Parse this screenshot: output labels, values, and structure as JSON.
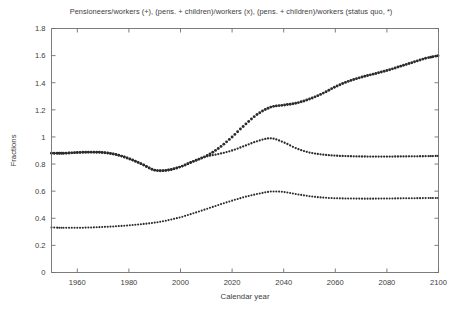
{
  "chart_data": {
    "type": "line",
    "title": "Pensioneers/workers (+), (pens. + children)/workers (x), (pens. + children)/workers (status quo, *)",
    "xlabel": "Calendar year",
    "ylabel": "Fractions",
    "xlim": [
      1950,
      2100
    ],
    "ylim": [
      0,
      1.8
    ],
    "xticks": [
      1960,
      1980,
      2000,
      2020,
      2040,
      2060,
      2080,
      2100
    ],
    "xticklabels": [
      "1960",
      "1980",
      "2000",
      "2020",
      "2040",
      "2060",
      "2080",
      "2100"
    ],
    "yticks": [
      0,
      0.2,
      0.4,
      0.6,
      0.8,
      1,
      1.2,
      1.4,
      1.6,
      1.8
    ],
    "yticklabels": [
      "0",
      "0.2",
      "0.4",
      "0.6",
      "0.8",
      "1",
      "1.2",
      "1.4",
      "1.6",
      "1.8"
    ],
    "grid": false,
    "legend": "none (series identified in title)",
    "marker_color": "#2b2b2b",
    "frame_color": "#6e6e6e",
    "x": [
      1950,
      1955,
      1960,
      1965,
      1970,
      1975,
      1980,
      1985,
      1990,
      1995,
      2000,
      2005,
      2010,
      2015,
      2020,
      2025,
      2030,
      2035,
      2040,
      2045,
      2050,
      2055,
      2060,
      2065,
      2070,
      2075,
      2080,
      2085,
      2090,
      2095,
      2100
    ],
    "series": [
      {
        "name": "Pensioneers/workers",
        "marker": "+",
        "values": [
          0.88,
          0.88,
          0.885,
          0.888,
          0.885,
          0.87,
          0.84,
          0.8,
          0.755,
          0.755,
          0.78,
          0.82,
          0.86,
          0.92,
          1.0,
          1.09,
          1.17,
          1.22,
          1.235,
          1.25,
          1.28,
          1.32,
          1.37,
          1.41,
          1.44,
          1.465,
          1.49,
          1.52,
          1.55,
          1.58,
          1.6
        ]
      },
      {
        "name": "(pens. + children)/workers",
        "marker": "x",
        "values": [
          0.88,
          0.88,
          0.885,
          0.888,
          0.885,
          0.87,
          0.84,
          0.8,
          0.755,
          0.755,
          0.78,
          0.82,
          0.855,
          0.875,
          0.9,
          0.935,
          0.97,
          0.99,
          0.96,
          0.915,
          0.885,
          0.87,
          0.862,
          0.858,
          0.856,
          0.855,
          0.855,
          0.856,
          0.857,
          0.858,
          0.86
        ]
      },
      {
        "name": "(pens. + children)/workers (status quo)",
        "marker": "*",
        "values": [
          0.332,
          0.33,
          0.33,
          0.332,
          0.336,
          0.341,
          0.348,
          0.357,
          0.368,
          0.385,
          0.408,
          0.437,
          0.468,
          0.5,
          0.53,
          0.558,
          0.58,
          0.597,
          0.594,
          0.578,
          0.563,
          0.553,
          0.548,
          0.546,
          0.545,
          0.545,
          0.546,
          0.547,
          0.548,
          0.549,
          0.55
        ]
      }
    ]
  }
}
